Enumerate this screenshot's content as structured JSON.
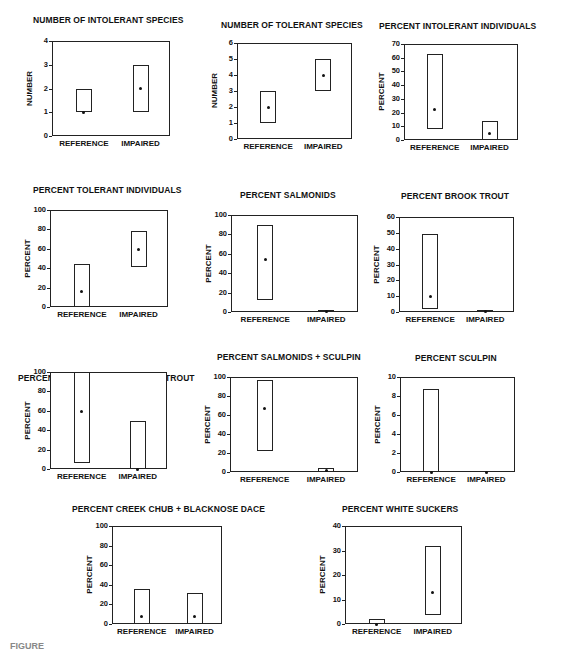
{
  "figure": {
    "caption": "FIGURE"
  },
  "chart_data": [
    {
      "type": "box-range",
      "title": "NUMBER OF INTOLERANT SPECIES",
      "ylabel": "NUMBER",
      "ylim": [
        0,
        4
      ],
      "yticks": [
        0,
        1,
        2,
        3,
        4
      ],
      "categories": [
        "REFERENCE",
        "IMPAIRED"
      ],
      "series": [
        {
          "name": "REFERENCE",
          "low": 1,
          "high": 2,
          "median": 1
        },
        {
          "name": "IMPAIRED",
          "low": 1,
          "high": 3,
          "median": 2
        }
      ]
    },
    {
      "type": "box-range",
      "title": "NUMBER OF TOLERANT SPECIES",
      "ylabel": "NUMBER",
      "ylim": [
        0,
        6
      ],
      "yticks": [
        0,
        1,
        2,
        3,
        4,
        5,
        6
      ],
      "categories": [
        "REFERENCE",
        "IMPAIRED"
      ],
      "series": [
        {
          "name": "REFERENCE",
          "low": 1,
          "high": 3,
          "median": 2
        },
        {
          "name": "IMPAIRED",
          "low": 3,
          "high": 5,
          "median": 4
        }
      ]
    },
    {
      "type": "box-range",
      "title": "PERCENT INTOLERANT INDIVIDUALS",
      "ylabel": "PERCENT",
      "ylim": [
        0,
        70
      ],
      "yticks": [
        0,
        10,
        20,
        30,
        40,
        50,
        60,
        70
      ],
      "categories": [
        "REFERENCE",
        "IMPAIRED"
      ],
      "series": [
        {
          "name": "REFERENCE",
          "low": 8,
          "high": 63,
          "median": 22
        },
        {
          "name": "IMPAIRED",
          "low": 0,
          "high": 14,
          "median": 5
        }
      ]
    },
    {
      "type": "box-range",
      "title": "PERCENT TOLERANT INDIVIDUALS",
      "ylabel": "PERCENT",
      "ylim": [
        0,
        100
      ],
      "yticks": [
        0,
        20,
        40,
        60,
        80,
        100
      ],
      "categories": [
        "REFERENCE",
        "IMPAIRED"
      ],
      "series": [
        {
          "name": "REFERENCE",
          "low": 0,
          "high": 44,
          "median": 16
        },
        {
          "name": "IMPAIRED",
          "low": 41,
          "high": 78,
          "median": 59
        }
      ]
    },
    {
      "type": "box-range",
      "title": "PERCENT SALMONIDS",
      "ylabel": "PERCENT",
      "ylim": [
        0,
        100
      ],
      "yticks": [
        0,
        20,
        40,
        60,
        80,
        100
      ],
      "categories": [
        "REFERENCE",
        "IMPAIRED"
      ],
      "series": [
        {
          "name": "REFERENCE",
          "low": 12,
          "high": 90,
          "median": 54
        },
        {
          "name": "IMPAIRED",
          "low": 0,
          "high": 2,
          "median": 1
        }
      ]
    },
    {
      "type": "box-range",
      "title": "PERCENT BROOK TROUT",
      "ylabel": "PERCENT",
      "ylim": [
        0,
        60
      ],
      "yticks": [
        0,
        10,
        20,
        30,
        40,
        50,
        60
      ],
      "categories": [
        "REFERENCE",
        "IMPAIRED"
      ],
      "series": [
        {
          "name": "REFERENCE",
          "low": 2,
          "high": 49,
          "median": 10
        },
        {
          "name": "IMPAIRED",
          "low": 0,
          "high": 1,
          "median": 0.5
        }
      ]
    },
    {
      "type": "box-range",
      "title": "PERCENT SALMONIDS AS BROOK TROUT",
      "ylabel": "PERCENT",
      "ylim": [
        0,
        100
      ],
      "yticks": [
        0,
        20,
        40,
        60,
        80,
        100
      ],
      "categories": [
        "REFERENCE",
        "IMPAIRED"
      ],
      "series": [
        {
          "name": "REFERENCE",
          "low": 6,
          "high": 100,
          "median": 59
        },
        {
          "name": "IMPAIRED",
          "low": 0,
          "high": 49,
          "median": 0
        }
      ]
    },
    {
      "type": "box-range",
      "title": "PERCENT SALMONIDS + SCULPIN",
      "ylabel": "PERCENT",
      "ylim": [
        0,
        100
      ],
      "yticks": [
        0,
        20,
        40,
        60,
        80,
        100
      ],
      "categories": [
        "REFERENCE",
        "IMPAIRED"
      ],
      "series": [
        {
          "name": "REFERENCE",
          "low": 22,
          "high": 97,
          "median": 67
        },
        {
          "name": "IMPAIRED",
          "low": 0,
          "high": 4,
          "median": 2
        }
      ]
    },
    {
      "type": "box-range",
      "title": "PERCENT SCULPIN",
      "ylabel": "PERCENT",
      "ylim": [
        0,
        10
      ],
      "yticks": [
        0,
        2,
        4,
        6,
        8,
        10
      ],
      "categories": [
        "REFERENCE",
        "IMPAIRED"
      ],
      "series": [
        {
          "name": "REFERENCE",
          "low": 0,
          "high": 8.7,
          "median": 0
        },
        {
          "name": "IMPAIRED",
          "low": 0,
          "high": 0,
          "median": 0
        }
      ]
    },
    {
      "type": "box-range",
      "title": "PERCENT CREEK CHUB + BLACKNOSE DACE",
      "ylabel": "PERCENT",
      "ylim": [
        0,
        100
      ],
      "yticks": [
        0,
        20,
        40,
        60,
        80,
        100
      ],
      "categories": [
        "REFERENCE",
        "IMPAIRED"
      ],
      "series": [
        {
          "name": "REFERENCE",
          "low": 0,
          "high": 36,
          "median": 8
        },
        {
          "name": "IMPAIRED",
          "low": 0,
          "high": 32,
          "median": 8
        }
      ]
    },
    {
      "type": "box-range",
      "title": "PERCENT WHITE SUCKERS",
      "ylabel": "PERCENT",
      "ylim": [
        0,
        40
      ],
      "yticks": [
        0,
        10,
        20,
        30,
        40
      ],
      "categories": [
        "REFERENCE",
        "IMPAIRED"
      ],
      "series": [
        {
          "name": "REFERENCE",
          "low": 0,
          "high": 2,
          "median": 0
        },
        {
          "name": "IMPAIRED",
          "low": 3.5,
          "high": 32,
          "median": 13
        }
      ]
    }
  ]
}
